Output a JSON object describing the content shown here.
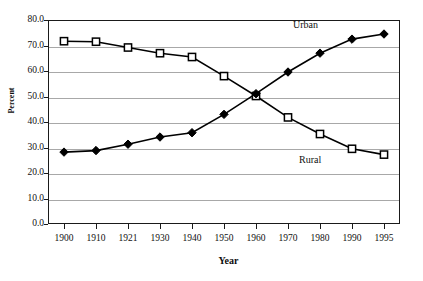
{
  "chart_data": {
    "type": "line",
    "title": "",
    "xlabel": "Year",
    "ylabel": "Percent",
    "categories": [
      "1900",
      "1910",
      "1921",
      "1930",
      "1940",
      "1950",
      "1960",
      "1970",
      "1980",
      "1990",
      "1995"
    ],
    "x": [
      1900,
      1910,
      1921,
      1930,
      1940,
      1950,
      1960,
      1970,
      1980,
      1990,
      1995
    ],
    "ylim": [
      0,
      80
    ],
    "yticks": [
      "0.0",
      "10.0",
      "20.0",
      "30.0",
      "40.0",
      "50.0",
      "60.0",
      "70.0",
      "80.0"
    ],
    "ytick_values": [
      0,
      10,
      20,
      30,
      40,
      50,
      60,
      70,
      80
    ],
    "grid": true,
    "legend_position": "inline-annotation",
    "series": [
      {
        "name": "Rural",
        "marker": "open-square",
        "color": "#000000",
        "values": [
          71.7,
          71.5,
          69.2,
          67.0,
          65.5,
          58.0,
          50.2,
          41.8,
          35.3,
          29.5,
          27.2
        ]
      },
      {
        "name": "Urban",
        "marker": "filled-diamond",
        "color": "#000000",
        "values": [
          28.2,
          28.8,
          31.3,
          34.1,
          35.8,
          43.0,
          51.1,
          59.6,
          67.0,
          72.5,
          74.5
        ]
      }
    ],
    "annotations": [
      {
        "text": "Urban",
        "x": 1970,
        "y": 80.5
      },
      {
        "text": "Rural",
        "x": 1972,
        "y": 27.0
      }
    ]
  },
  "axes": {
    "y_title": "Percent",
    "x_title": "Year"
  }
}
